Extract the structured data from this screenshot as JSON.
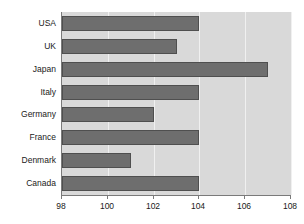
{
  "chart_data": {
    "type": "bar",
    "orientation": "horizontal",
    "title": "",
    "subtitle": "",
    "xlabel": "",
    "ylabel": "",
    "categories": [
      "USA",
      "UK",
      "Japan",
      "Italy",
      "Germany",
      "France",
      "Denmark",
      "Canada"
    ],
    "values": [
      104,
      103,
      107,
      104,
      102,
      104,
      101,
      104
    ],
    "series": [
      {
        "name": "",
        "values": [
          104,
          103,
          107,
          104,
          102,
          104,
          101,
          104
        ]
      }
    ],
    "xlim": [
      98,
      108
    ],
    "xticks": [
      98,
      100,
      102,
      104,
      106,
      108
    ],
    "xtick_labels": [
      "98",
      "100",
      "102",
      "104",
      "106",
      "108"
    ],
    "baseline": 98,
    "grid": true,
    "gridlines_axis": "x",
    "legend": false,
    "legend_position": "none",
    "annotations": []
  },
  "style": {
    "canvas_background": "#ffffff",
    "plot_background": "#d9d9d9",
    "bar_fill": "#6e6e6e",
    "bar_border": "#4f4f4f",
    "gridline_color": "#f0f0f0",
    "axis_color": "#7a7a7a",
    "text_color": "#1a1a1a"
  }
}
